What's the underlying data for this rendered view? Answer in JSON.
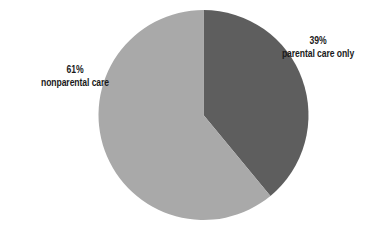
{
  "chart_data": {
    "type": "pie",
    "title": "",
    "start_angle_deg": 0,
    "direction": "clockwise",
    "slices": [
      {
        "label": "parental care only",
        "value": 39,
        "display": "39%",
        "color": "#5e5e5e"
      },
      {
        "label": "nonparental care",
        "value": 61,
        "display": "61%",
        "color": "#a9a9a9"
      }
    ],
    "geometry": {
      "cx": 203.5,
      "cy": 115,
      "r": 105
    }
  },
  "labels": {
    "parental": {
      "pct": "39%",
      "text": "parental care only"
    },
    "nonparental": {
      "pct": "61%",
      "text": "nonparental care"
    }
  }
}
